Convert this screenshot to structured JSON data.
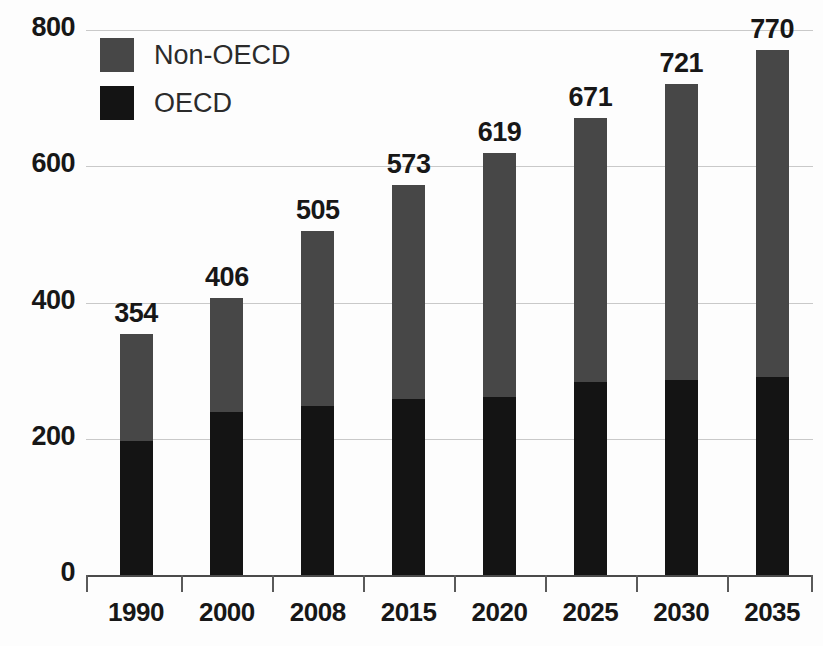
{
  "chart_data": {
    "type": "bar",
    "title": "",
    "subtitle": "",
    "xlabel": "",
    "ylabel": "",
    "stacked": true,
    "grid": true,
    "legend_position": "top-left",
    "ylim": [
      0,
      800
    ],
    "yticks": [
      0,
      200,
      400,
      600,
      800
    ],
    "ytick_labels": [
      "0",
      "200",
      "400",
      "600",
      "800"
    ],
    "categories": [
      "1990",
      "2000",
      "2008",
      "2015",
      "2020",
      "2025",
      "2030",
      "2035"
    ],
    "series": [
      {
        "name": "OECD",
        "color": "#141414",
        "values": [
          197,
          240,
          248,
          258,
          262,
          283,
          286,
          290
        ]
      },
      {
        "name": "Non-OECD",
        "color": "#474747",
        "values": [
          157,
          166,
          257,
          315,
          357,
          388,
          435,
          480
        ]
      }
    ],
    "totals": [
      354,
      406,
      505,
      573,
      619,
      671,
      721,
      770
    ],
    "total_labels": [
      "354",
      "406",
      "505",
      "573",
      "619",
      "671",
      "721",
      "770"
    ]
  },
  "legend": {
    "items": [
      {
        "label": "Non-OECD",
        "swatch": "nonoecd"
      },
      {
        "label": "OECD",
        "swatch": "oecd"
      }
    ]
  }
}
